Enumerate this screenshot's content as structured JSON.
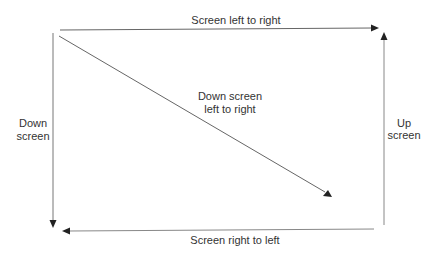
{
  "diagram": {
    "labels": {
      "top": "Screen left to right",
      "diagonal_line1": "Down screen",
      "diagonal_line2": "left to right",
      "left_line1": "Down",
      "left_line2": "screen",
      "right_line1": "Up",
      "right_line2": "screen",
      "bottom": "Screen right to left"
    },
    "colors": {
      "stroke": "#555555",
      "arrowhead": "#222222",
      "text": "#333333"
    }
  }
}
